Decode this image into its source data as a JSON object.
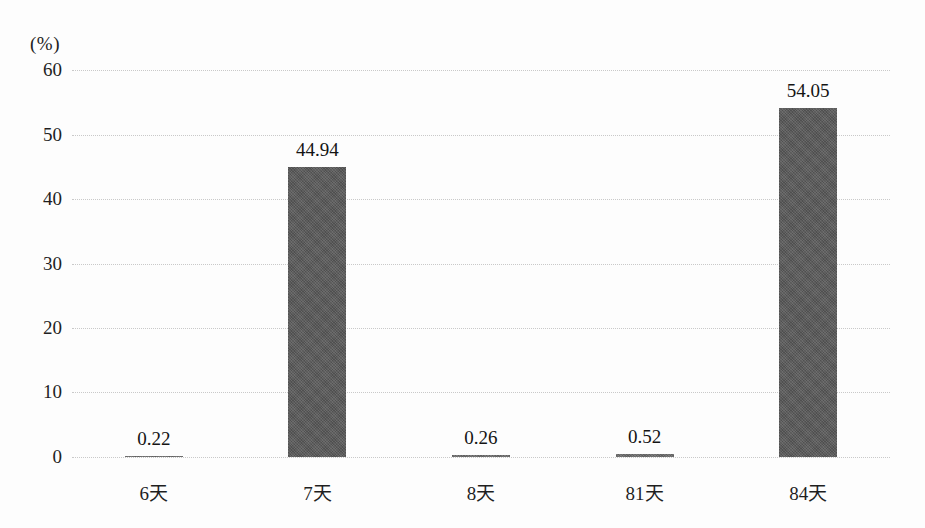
{
  "chart_data": {
    "type": "bar",
    "title": "",
    "subtitle": "",
    "unit_label": "(%)",
    "xlabel": "",
    "ylabel": "",
    "ylim": [
      0,
      60
    ],
    "ytick_values": [
      0,
      10,
      20,
      30,
      40,
      50,
      60
    ],
    "ytick_labels": [
      "0",
      "10",
      "20",
      "30",
      "40",
      "50",
      "60"
    ],
    "grid": true,
    "grid_axis": "y",
    "legend": false,
    "legend_position": "none",
    "categories": [
      "6天",
      "7天",
      "8天",
      "81天",
      "84天"
    ],
    "values": [
      0.22,
      44.94,
      0.26,
      0.52,
      54.05
    ],
    "value_labels": [
      "0.22",
      "44.94",
      "0.26",
      "0.52",
      "54.05"
    ],
    "bar_color": "#595959",
    "grid_color": "#c9c9c9",
    "background_color": "#fdfdfd"
  }
}
